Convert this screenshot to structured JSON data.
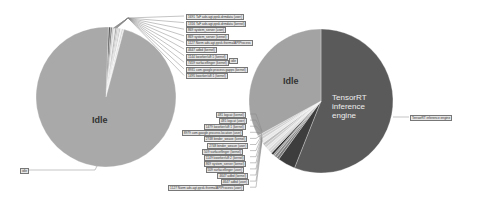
{
  "chart_data": [
    {
      "type": "pie",
      "title": "",
      "center_label": "Idle",
      "slices": [
        {
          "label": "Idle",
          "value": 96.4,
          "color": "#a9a9a9"
        },
        {
          "label": "1691 TaF ads.agt.ppsk.drmdata (user)",
          "value": 0.5,
          "color": "#555555"
        },
        {
          "label": "1316 TaF ads.agt.ppsk.drmdata (kernel)",
          "value": 0.4,
          "color": "#777777"
        },
        {
          "label": "869 system_server (user)",
          "value": 0.4,
          "color": "#c8c8c8"
        },
        {
          "label": "869 system_server (kernel)",
          "value": 0.3,
          "color": "#e0e0e0"
        },
        {
          "label": "1127 Norm ads.agt.ppsk.thermalAPIProcess",
          "value": 0.3,
          "color": "#909090"
        },
        {
          "label": "4647 adbd (kernel)",
          "value": 0.3,
          "color": "#b8b8b8"
        },
        {
          "label": "1144 kworker/u8:1 (kernel)",
          "value": 0.3,
          "color": "#d0d0d0"
        },
        {
          "label": "7459 surfaceflinger (kernel)",
          "value": 0.3,
          "color": "#bcbcbc"
        },
        {
          "label": "8931 com.google.process.gapps (kernel)",
          "value": 0.3,
          "color": "#f0f0f0"
        },
        {
          "label": "1495 kworker/u8:1 (kernel)",
          "value": 0.3,
          "color": "#cccccc"
        },
        {
          "label": "idle",
          "value": 0.2,
          "color": "#dddddd"
        }
      ]
    },
    {
      "type": "pie",
      "title": "",
      "slices": [
        {
          "label": "TensorRT inference engine",
          "value": 56.0,
          "color": "#5a5a5a"
        },
        {
          "label": "Idle",
          "value": 33.0,
          "color": "#a3a3a3"
        },
        {
          "label": "481 logcat (kernel)",
          "value": 0.5,
          "color": "#2e2e2e"
        },
        {
          "label": "481 logcat (user)",
          "value": 0.5,
          "color": "#c4c4c4"
        },
        {
          "label": "1479 kworker/u8:1 (kernel)",
          "value": 0.6,
          "color": "#d8d8d8"
        },
        {
          "label": "8979 com.google.process.location (user)",
          "value": 0.6,
          "color": "#e6e6e6"
        },
        {
          "label": "2748 binder_weave (kernel)",
          "value": 0.6,
          "color": "#cfcfcf"
        },
        {
          "label": "2748 binder_weave (user)",
          "value": 0.6,
          "color": "#bdbdbd"
        },
        {
          "label": "509 surfaceflinger (kernel)",
          "value": 0.8,
          "color": "#e9e9e9"
        },
        {
          "label": "1149 kworker/u8:2 (kernel)",
          "value": 0.6,
          "color": "#d2d2d2"
        },
        {
          "label": "869 system_server (kernel)",
          "value": 0.6,
          "color": "#c9c9c9"
        },
        {
          "label": "509 surfaceflinger (user)",
          "value": 4.0,
          "color": "#3d3d3d"
        },
        {
          "label": "4647 adbd (kernel)",
          "value": 0.6,
          "color": "#7a7a7a"
        },
        {
          "label": "4647 adbd (user)",
          "value": 0.6,
          "color": "#8a8a8a"
        },
        {
          "label": "1127 Norm ads.agt.ppsk.thermalAPIProcess (user)",
          "value": 0.4,
          "color": "#9a9a9a"
        }
      ]
    }
  ]
}
